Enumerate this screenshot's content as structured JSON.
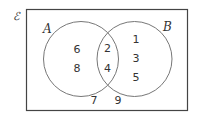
{
  "diagram": {
    "type": "venn",
    "universal_label": "ℰ",
    "sets": [
      {
        "name": "A",
        "label": "A"
      },
      {
        "name": "B",
        "label": "B"
      }
    ],
    "regions": {
      "A_only": [
        "6",
        "8"
      ],
      "A_and_B": [
        "2",
        "4"
      ],
      "B_only": [
        "1",
        "3",
        "5"
      ],
      "neither": [
        "7",
        "9"
      ]
    }
  }
}
